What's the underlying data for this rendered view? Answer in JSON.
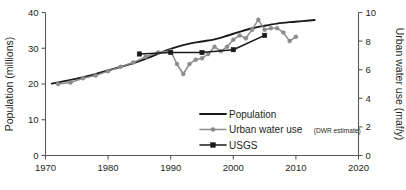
{
  "chart_data": {
    "type": "line",
    "title": "",
    "subtitle": "",
    "xlabel": "",
    "ylabel": "Population (millions)",
    "y2label": "Urban water use (maf/y)",
    "xlim": [
      1970,
      2020
    ],
    "ylim": [
      0,
      40
    ],
    "y2lim": [
      0,
      10
    ],
    "xticks": [
      1970,
      1980,
      1990,
      2000,
      2010,
      2020
    ],
    "xticklabels": [
      "1970",
      "1980",
      "1990",
      "2000",
      "2010",
      "2020"
    ],
    "yticks": [
      0,
      10,
      20,
      30,
      40
    ],
    "yticklabels": [
      "0",
      "10",
      "20",
      "30",
      "40"
    ],
    "y2ticks": [
      0,
      2,
      4,
      6,
      8,
      10
    ],
    "y2ticklabels": [
      "0",
      "2",
      "4",
      "6",
      "8",
      "10"
    ],
    "grid": false,
    "legend_position": "inside lower-center-right",
    "series": [
      {
        "name": "Population",
        "axis": "left",
        "color": "#1a1a1a",
        "marker": "none",
        "x": [
          1971,
          1973,
          1975,
          1977,
          1979,
          1981,
          1983,
          1985,
          1987,
          1989,
          1991,
          1993,
          1995,
          1997,
          1999,
          2001,
          2003,
          2005,
          2007,
          2009,
          2011,
          2013
        ],
        "values": [
          20.1,
          20.8,
          21.5,
          22.3,
          23.3,
          24.3,
          25.3,
          26.4,
          27.7,
          29.2,
          30.4,
          31.3,
          31.9,
          32.5,
          33.5,
          34.6,
          35.6,
          36.3,
          36.9,
          37.3,
          37.6,
          37.9
        ]
      },
      {
        "name": "Urban water use (DWR estimate)",
        "axis": "right",
        "color": "#8c8c8c",
        "marker": "circle",
        "x": [
          1972,
          1974,
          1976,
          1978,
          1980,
          1982,
          1984,
          1986,
          1988,
          1990,
          1991,
          1992,
          1993,
          1994,
          1995,
          1996,
          1997,
          1998,
          1999,
          2000,
          2001,
          2002,
          2003,
          2004,
          2005,
          2006,
          2007,
          2008,
          2009,
          2010
        ],
        "values": [
          5.0,
          5.1,
          5.4,
          5.6,
          5.9,
          6.2,
          6.5,
          6.9,
          7.2,
          7.3,
          6.4,
          5.7,
          6.4,
          6.7,
          6.8,
          7.1,
          7.6,
          7.3,
          7.6,
          8.1,
          8.4,
          8.2,
          8.8,
          9.5,
          8.8,
          8.9,
          8.9,
          8.6,
          8.0,
          8.3
        ]
      },
      {
        "name": "USGS",
        "axis": "right",
        "color": "#1a1a1a",
        "marker": "square",
        "x": [
          1985,
          1990,
          1995,
          2000,
          2005
        ],
        "values": [
          7.1,
          7.2,
          7.2,
          7.4,
          8.4
        ]
      }
    ]
  },
  "legend": {
    "items": [
      {
        "label": "Population",
        "sub": "",
        "marker": "line",
        "color": "#1a1a1a"
      },
      {
        "label": "Urban water use",
        "sub": "(DWR estimate)",
        "marker": "line-circle",
        "color": "#8c8c8c"
      },
      {
        "label": "USGS",
        "sub": "",
        "marker": "line-square",
        "color": "#1a1a1a"
      }
    ]
  }
}
